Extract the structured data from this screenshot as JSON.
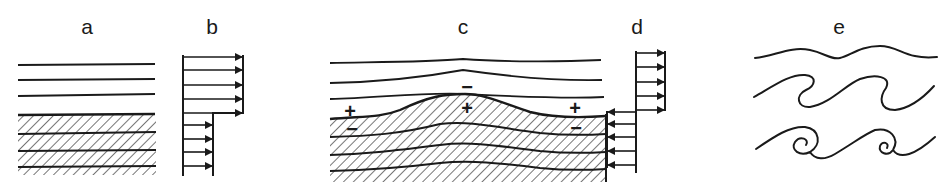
{
  "figure": {
    "colors": {
      "ink": "#1a1a1a",
      "background": "#ffffff"
    }
  },
  "panels": [
    {
      "id": "a",
      "label": "a",
      "content": "stratified fluid layers; lower layer hatched (denser)"
    },
    {
      "id": "b",
      "label": "b",
      "content": "velocity profile: upper layer faster (5 arrows right), lower layer slower (4 arrows right)"
    },
    {
      "id": "c",
      "label": "c",
      "content": "perturbed interface wave with pressure perturbation signs",
      "signs": [
        {
          "symbol": "+",
          "position": "above-left-trough"
        },
        {
          "symbol": "−",
          "position": "below-left-trough"
        },
        {
          "symbol": "−",
          "position": "above-crest"
        },
        {
          "symbol": "+",
          "position": "below-crest"
        },
        {
          "symbol": "+",
          "position": "above-right-trough"
        },
        {
          "symbol": "−",
          "position": "below-right-trough"
        }
      ]
    },
    {
      "id": "d",
      "label": "d",
      "content": "velocity profile in moving frame: upper layer arrows right (5), lower layer arrows left (5)"
    },
    {
      "id": "e",
      "label": "e",
      "content": "evolution into Kelvin-Helmholtz billows: wavy line, breaking waves, rolled-up vortices"
    }
  ]
}
